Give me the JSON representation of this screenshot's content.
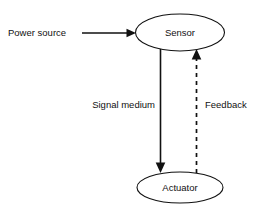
{
  "diagram": {
    "type": "block-flow-diagram",
    "background_color": "#ffffff",
    "stroke_color": "#111111",
    "text_color": "#111111",
    "nodes": [
      {
        "id": "sensor",
        "label": "Sensor",
        "shape": "ellipse",
        "cx": 180,
        "cy": 32.5,
        "rx": 44.5,
        "ry": 18.5
      },
      {
        "id": "actuator",
        "label": "Actuator",
        "shape": "ellipse",
        "cx": 180,
        "cy": 187.5,
        "rx": 43,
        "ry": 15.5
      }
    ],
    "edges": [
      {
        "id": "power-source-edge",
        "label": "Power source",
        "style": "solid",
        "direction": "right",
        "target": "sensor"
      },
      {
        "id": "signal-medium-edge",
        "label": "Signal medium",
        "style": "solid",
        "direction": "down",
        "source": "sensor",
        "target": "actuator"
      },
      {
        "id": "feedback-edge",
        "label": "Feedback",
        "style": "dashed",
        "direction": "up",
        "source": "actuator",
        "target": "sensor"
      }
    ]
  }
}
